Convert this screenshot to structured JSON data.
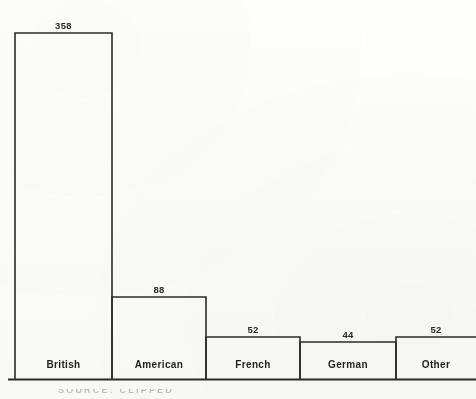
{
  "chart_data": {
    "type": "bar",
    "title": "",
    "subtitle": "",
    "xlabel": "",
    "ylabel": "",
    "categories": [
      "British",
      "American",
      "French",
      "German",
      "Other"
    ],
    "values": [
      358,
      88,
      52,
      44,
      52
    ],
    "value_labels": [
      "358",
      "88",
      "52",
      "44",
      "52"
    ],
    "ylim": [
      0,
      358
    ],
    "grid": false,
    "legend": false,
    "legend_position": "none",
    "orientation": "vertical",
    "bar_style": "outline"
  },
  "style": {
    "background_color": "#fdfdfb",
    "line_color": "#2b2b2b",
    "text_color": "#1f1f1f",
    "value_text_color": "#2a2a2a"
  },
  "geometry": {
    "baseline_y": 379,
    "bar_edges_x": [
      15,
      112,
      206,
      300,
      396,
      476
    ],
    "bar_top_y": [
      33,
      297,
      337,
      342,
      337
    ]
  },
  "caption": {
    "clipped_text": "SOURCE: CLIPPED"
  }
}
